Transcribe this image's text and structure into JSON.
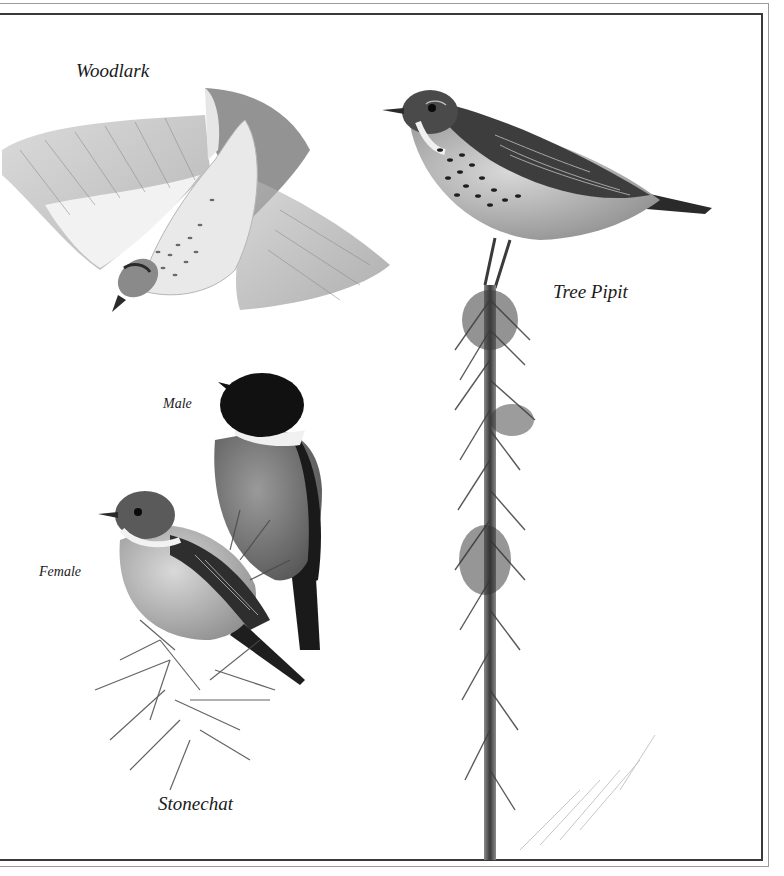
{
  "plate": {
    "labels": {
      "woodlark": "Woodlark",
      "tree_pipit": "Tree Pipit",
      "stonechat_male": "Male",
      "stonechat_female": "Female",
      "stonechat": "Stonechat"
    },
    "colors": {
      "background": "#ffffff",
      "frame_outer": "#9a9a9a",
      "frame_inner": "#3a3a3a",
      "ink_dark": "#1a1a1a",
      "ink_mid": "#6e6e6e",
      "ink_light": "#c8c8c8"
    }
  }
}
